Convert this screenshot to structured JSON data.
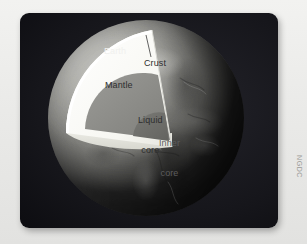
{
  "figure": {
    "panel_background": "#16161b",
    "credit": "NGDC"
  },
  "labels": {
    "earth": "Earth",
    "crust": "Crust",
    "mantle": "Mantle",
    "liquid_core_line1": "Liquid",
    "liquid_core_line2": "core",
    "inner_core_line1": "Inner",
    "inner_core_line2": "core"
  },
  "layers": [
    {
      "name": "Crust",
      "color": "#f2f2ee",
      "label": "Crust"
    },
    {
      "name": "Mantle",
      "color": "#fbfbf7",
      "label": "Mantle"
    },
    {
      "name": "Liquid core",
      "color": "#8a8a86",
      "label": "Liquid core"
    },
    {
      "name": "Inner core",
      "color": "#6e6e6a",
      "label": "Inner core"
    }
  ],
  "globe": {
    "surface_tone": "#a9a9a4",
    "shadow_tone": "#2b2b2b"
  },
  "credit": {
    "text": "NGDC"
  }
}
